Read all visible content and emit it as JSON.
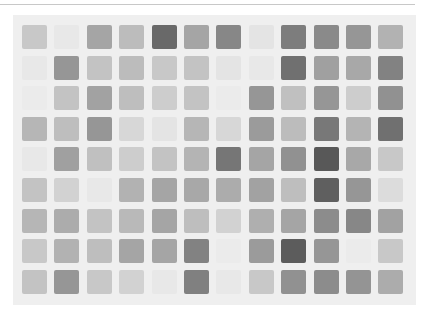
{
  "image": {
    "description": "Grid of grayscale swatches on light gray panel",
    "background_color": "#ffffff",
    "panel_color": "#efefef",
    "rule_color": "#c8c8c8"
  },
  "chart_data": {
    "type": "heatmap",
    "title": "",
    "xlabel": "",
    "ylabel": "",
    "rows": 9,
    "cols": 12,
    "value_meaning": "gray level 0-255 (lower = darker)",
    "values": [
      [
        200,
        232,
        165,
        188,
        105,
        165,
        135,
        228,
        125,
        138,
        150,
        178
      ],
      [
        232,
        150,
        195,
        188,
        200,
        195,
        228,
        232,
        112,
        160,
        168,
        130
      ],
      [
        235,
        195,
        162,
        190,
        205,
        195,
        235,
        150,
        192,
        150,
        205,
        145
      ],
      [
        182,
        190,
        150,
        215,
        228,
        182,
        215,
        155,
        188,
        120,
        180,
        112
      ],
      [
        232,
        160,
        192,
        205,
        195,
        180,
        118,
        165,
        145,
        88,
        168,
        200
      ],
      [
        195,
        210,
        232,
        178,
        165,
        168,
        172,
        162,
        190,
        95,
        150,
        220
      ],
      [
        182,
        172,
        195,
        185,
        165,
        190,
        210,
        175,
        165,
        140,
        135,
        162
      ],
      [
        200,
        178,
        190,
        165,
        165,
        130,
        235,
        155,
        92,
        150,
        235,
        200
      ],
      [
        195,
        150,
        200,
        210,
        232,
        128,
        232,
        200,
        145,
        140,
        148,
        172
      ]
    ]
  }
}
